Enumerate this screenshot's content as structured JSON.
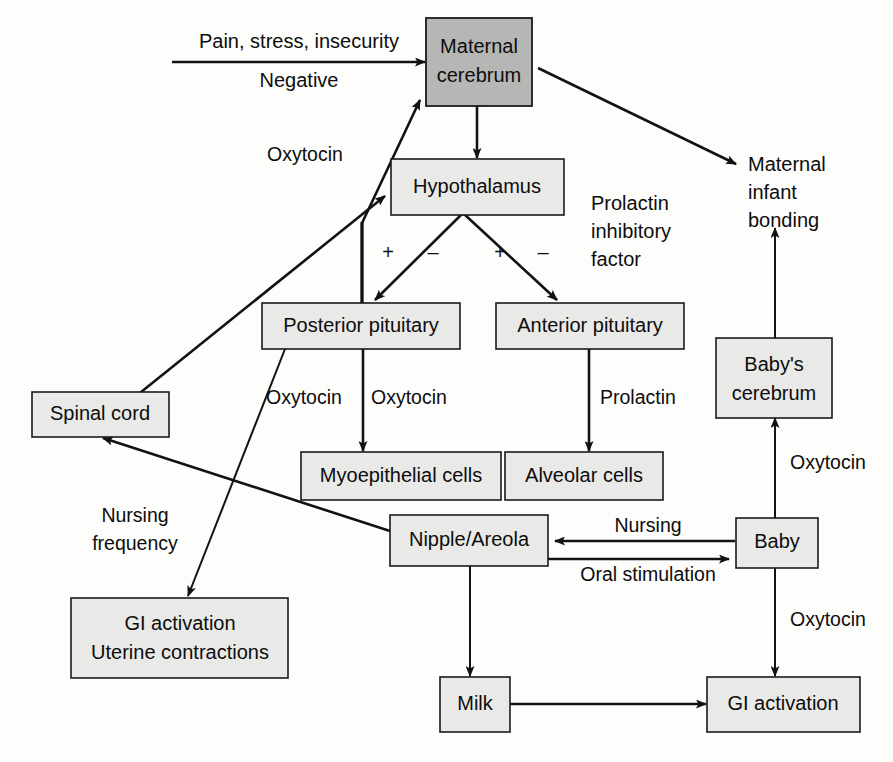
{
  "diagram": {
    "colors": {
      "node_fill": "#e9e9e7",
      "node_fill_highlight": "#b6b6b4",
      "stroke": "#121212",
      "background": "#fdfdfb"
    },
    "nodes": [
      {
        "id": "maternal-cerebrum",
        "label_line1": "Maternal",
        "label_line2": "cerebrum",
        "highlight": true
      },
      {
        "id": "hypothalamus",
        "label_line1": "Hypothalamus",
        "label_line2": "",
        "highlight": false
      },
      {
        "id": "posterior-pituitary",
        "label_line1": "Posterior pituitary",
        "label_line2": "",
        "highlight": false
      },
      {
        "id": "anterior-pituitary",
        "label_line1": "Anterior pituitary",
        "label_line2": "",
        "highlight": false
      },
      {
        "id": "spinal-cord",
        "label_line1": "Spinal cord",
        "label_line2": "",
        "highlight": false
      },
      {
        "id": "myoepithelial-cells",
        "label_line1": "Myoepithelial cells",
        "label_line2": "",
        "highlight": false
      },
      {
        "id": "alveolar-cells",
        "label_line1": "Alveolar cells",
        "label_line2": "",
        "highlight": false
      },
      {
        "id": "nipple-areola",
        "label_line1": "Nipple/Areola",
        "label_line2": "",
        "highlight": false
      },
      {
        "id": "gi-uterine",
        "label_line1": "GI activation",
        "label_line2": "Uterine contractions",
        "highlight": false
      },
      {
        "id": "milk",
        "label_line1": "Milk",
        "label_line2": "",
        "highlight": false
      },
      {
        "id": "gi-activation",
        "label_line1": "GI activation",
        "label_line2": "",
        "highlight": false
      },
      {
        "id": "baby",
        "label_line1": "Baby",
        "label_line2": "",
        "highlight": false
      },
      {
        "id": "babys-cerebrum",
        "label_line1": "Baby's",
        "label_line2": "cerebrum",
        "highlight": false
      }
    ],
    "free_text": {
      "pain_stress": "Pain, stress, insecurity",
      "negative": "Negative",
      "maternal_infant_bonding_1": "Maternal",
      "maternal_infant_bonding_2": "infant",
      "maternal_infant_bonding_3": "bonding",
      "prolactin_inhibitory_1": "Prolactin",
      "prolactin_inhibitory_2": "inhibitory",
      "prolactin_inhibitory_3": "factor"
    },
    "edge_labels": {
      "oxytocin_to_cerebrum": "Oxytocin",
      "oxytocin_pp_left": "Oxytocin",
      "oxytocin_pp_right": "Oxytocin",
      "prolactin": "Prolactin",
      "nursing_frequency_1": "Nursing",
      "nursing_frequency_2": "frequency",
      "nursing": "Nursing",
      "oral_stimulation": "Oral stimulation",
      "oxytocin_baby_up": "Oxytocin",
      "oxytocin_baby_down": "Oxytocin"
    },
    "signs": {
      "pp_plus": "+",
      "pp_minus": "–",
      "ap_plus": "+",
      "ap_minus": "–"
    },
    "edges": [
      {
        "from": "pain-stress-insecurity",
        "to": "maternal-cerebrum",
        "label": "Pain, stress, insecurity / Negative"
      },
      {
        "from": "maternal-cerebrum",
        "to": "hypothalamus",
        "label": "",
        "bidirectional": true
      },
      {
        "from": "maternal-cerebrum",
        "to": "maternal-infant-bonding",
        "label": ""
      },
      {
        "from": "posterior-pituitary",
        "to": "maternal-cerebrum",
        "label": "Oxytocin"
      },
      {
        "from": "spinal-cord",
        "to": "hypothalamus",
        "label": ""
      },
      {
        "from": "hypothalamus",
        "to": "posterior-pituitary",
        "label": "+ –"
      },
      {
        "from": "hypothalamus",
        "to": "anterior-pituitary",
        "label": "+ – (Prolactin inhibitory factor)"
      },
      {
        "from": "posterior-pituitary",
        "to": "myoepithelial-cells",
        "label": "Oxytocin"
      },
      {
        "from": "posterior-pituitary",
        "to": "gi-uterine",
        "label": "Oxytocin"
      },
      {
        "from": "anterior-pituitary",
        "to": "alveolar-cells",
        "label": "Prolactin"
      },
      {
        "from": "nipple-areola",
        "to": "spinal-cord",
        "label": "Nursing frequency"
      },
      {
        "from": "baby",
        "to": "nipple-areola",
        "label": "Nursing"
      },
      {
        "from": "nipple-areola",
        "to": "baby",
        "label": "Oral stimulation"
      },
      {
        "from": "nipple-areola",
        "to": "milk",
        "label": ""
      },
      {
        "from": "milk",
        "to": "gi-activation",
        "label": ""
      },
      {
        "from": "baby",
        "to": "babys-cerebrum",
        "label": "Oxytocin"
      },
      {
        "from": "baby",
        "to": "gi-activation",
        "label": "Oxytocin"
      },
      {
        "from": "babys-cerebrum",
        "to": "maternal-infant-bonding",
        "label": ""
      }
    ]
  }
}
